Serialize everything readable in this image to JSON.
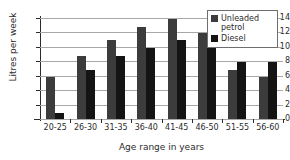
{
  "chart_data": {
    "type": "bar",
    "title": "",
    "xlabel": "Age range in years",
    "ylabel": "Litres per week",
    "categories": [
      "20-25",
      "26-30",
      "31-35",
      "36-40",
      "41-45",
      "46-50",
      "51-55",
      "56-60"
    ],
    "series": [
      {
        "name": "Unleaded petrol",
        "color": "#3c3c3c",
        "values": [
          5.8,
          8.8,
          10.9,
          12.8,
          13.9,
          11.9,
          6.8,
          5.8
        ]
      },
      {
        "name": "Diesel",
        "color": "#141414",
        "values": [
          0.8,
          6.8,
          8.8,
          9.9,
          10.9,
          9.8,
          7.9,
          7.9
        ]
      }
    ],
    "ylim": [
      0,
      14
    ],
    "yticks": [
      0,
      2,
      4,
      6,
      8,
      10,
      12,
      14
    ],
    "ytick_labels": [
      "0",
      "2",
      "4",
      "6",
      "8",
      "10",
      "12",
      "14"
    ],
    "grid": true,
    "legend_position": "top-right"
  }
}
